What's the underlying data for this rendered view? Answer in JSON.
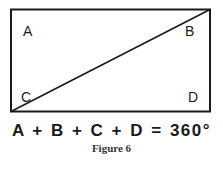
{
  "diagram": {
    "shape": "rectangle",
    "diagonal": "bottom-left to top-right",
    "corner_labels": {
      "top_left": "A",
      "top_right": "B",
      "bottom_left": "C",
      "bottom_right": "D"
    },
    "equation": "A + B + C + D = 360°",
    "caption": "Figure 6",
    "stroke_color": "#1a1a1a"
  }
}
